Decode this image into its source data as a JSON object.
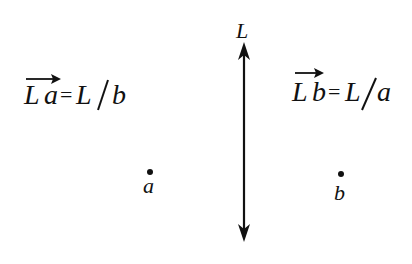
{
  "diagram": {
    "line": {
      "label": "L",
      "type": "double-headed vertical arrow",
      "x": 244,
      "y_top": 42,
      "y_bottom": 242
    },
    "left_side": {
      "vector": "La",
      "vector_L": "L",
      "vector_sub": "a",
      "equals": "=",
      "rhs_L": "L",
      "slash": "/",
      "rhs_den": "b",
      "point_label": "a"
    },
    "right_side": {
      "vector": "Lb",
      "vector_L": "L",
      "vector_sub": "b",
      "equals": "=",
      "rhs_L": "L",
      "slash": "/",
      "rhs_den": "a",
      "point_label": "b"
    },
    "colors": {
      "ink": "#111111",
      "background": "#ffffff"
    }
  }
}
